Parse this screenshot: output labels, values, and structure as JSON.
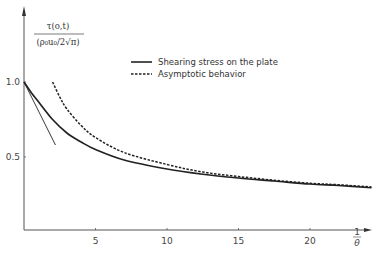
{
  "chart_data": {
    "type": "line",
    "title": "",
    "xlabel": "1/θ",
    "ylabel_numerator": "τ(o,t)",
    "ylabel_denominator": "(ρ₀u₀/2√π)",
    "xlim": [
      0,
      25
    ],
    "ylim": [
      0,
      1.2
    ],
    "grid": false,
    "legend_position": "upper-center",
    "x_ticks": [
      5,
      10,
      15,
      20
    ],
    "x_tick_labels": [
      "5",
      "10",
      "15",
      "20"
    ],
    "x_axis_end_label_num": "1",
    "x_axis_end_label_den": "θ",
    "y_ticks": [
      0.5,
      1.0
    ],
    "y_tick_labels": [
      "0.5",
      "1.0"
    ],
    "series": [
      {
        "name": "Shearing stress on the plate",
        "style": "solid",
        "x": [
          0,
          0.5,
          1,
          2,
          3,
          4,
          5,
          7,
          10,
          12.5,
          15,
          17.5,
          20,
          22,
          24.3
        ],
        "values": [
          1.0,
          0.93,
          0.87,
          0.75,
          0.66,
          0.6,
          0.55,
          0.48,
          0.42,
          0.385,
          0.36,
          0.34,
          0.32,
          0.31,
          0.295
        ]
      },
      {
        "name": "Asymptotic behavior",
        "style": "dashed",
        "x": [
          2,
          2.5,
          3,
          4,
          5,
          7,
          10,
          12.5,
          15,
          17.5,
          20,
          22,
          24.3
        ],
        "values": [
          1.0,
          0.9,
          0.82,
          0.71,
          0.63,
          0.53,
          0.45,
          0.4,
          0.37,
          0.345,
          0.325,
          0.315,
          0.3
        ]
      },
      {
        "name": "Initial tangent",
        "style": "thin-solid",
        "x": [
          0,
          2.2
        ],
        "values": [
          1.0,
          0.58
        ]
      }
    ],
    "legend": [
      {
        "label": "Shearing stress on the plate",
        "style": "solid"
      },
      {
        "label": "Asymptotic behavior",
        "style": "dashed"
      }
    ]
  },
  "layout": {
    "origin_px": [
      24,
      232
    ],
    "px_per_x": 14.3,
    "px_per_y": 150,
    "line_color": "#222222",
    "axis_color": "#555555"
  }
}
